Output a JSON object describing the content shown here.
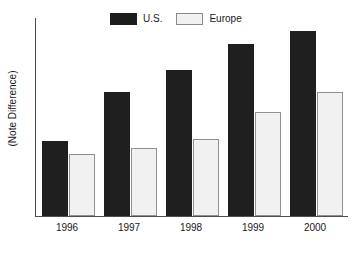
{
  "chart_data": {
    "type": "bar",
    "title": "",
    "subtitle": "",
    "xlabel": "",
    "ylabel": "(Note Difference)",
    "categories": [
      "1996",
      "1997",
      "1998",
      "1999",
      "2000"
    ],
    "series": [
      {
        "name": "U.S.",
        "color": "#1f1f1f",
        "values": [
          75,
          124,
          146,
          172,
          185
        ]
      },
      {
        "name": "Europe",
        "color": "#f1f1f1",
        "values": [
          62,
          68,
          77,
          104,
          124
        ]
      }
    ],
    "legend": {
      "position": "top-center",
      "entries": [
        {
          "label": "U.S.",
          "swatch": "dark-filled-swatch"
        },
        {
          "label": "Europe",
          "swatch": "light-outlined-swatch"
        }
      ]
    },
    "axes": {
      "y_axis_visible": true,
      "x_axis_visible": true,
      "y_tick_labels": [],
      "ylim": [
        0,
        198
      ],
      "grid": false
    },
    "colors": {
      "us_bar": "#1f1f1f",
      "europe_bar": "#f1f1f1",
      "europe_bar_border": "#8f8f8f",
      "axis": "#4d4d4d",
      "text": "#1a1a1a",
      "background": "#ffffff"
    }
  }
}
